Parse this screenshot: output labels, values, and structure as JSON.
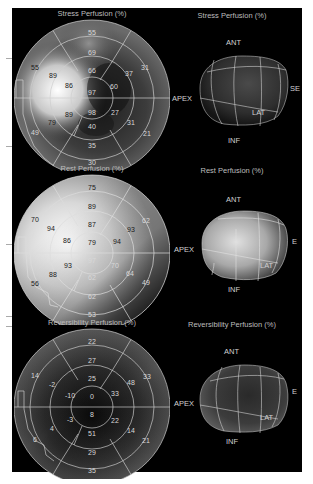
{
  "panels": [
    {
      "id": "stress",
      "map_title": "Stress Perfusion (%)",
      "render_title": "Stress Perfusion (%)",
      "orientation": {
        "ant": "ANT",
        "apex": "APEX",
        "base": "BASE",
        "lat": "LAT",
        "inf": "INF"
      },
      "segments": [
        {
          "v": "55",
          "x": 78,
          "y": 18,
          "light": true
        },
        {
          "v": "69",
          "x": 78,
          "y": 38,
          "light": true
        },
        {
          "v": "66",
          "x": 78,
          "y": 56,
          "light": true
        },
        {
          "v": "97",
          "x": 78,
          "y": 78,
          "light": true
        },
        {
          "v": "60",
          "x": 100,
          "y": 72,
          "light": true
        },
        {
          "v": "37",
          "x": 115,
          "y": 59,
          "light": true
        },
        {
          "v": "31",
          "x": 131,
          "y": 53,
          "light": true
        },
        {
          "v": "98",
          "x": 78,
          "y": 98,
          "light": true
        },
        {
          "v": "27",
          "x": 101,
          "y": 98,
          "light": true
        },
        {
          "v": "31",
          "x": 117,
          "y": 108,
          "light": true
        },
        {
          "v": "21",
          "x": 133,
          "y": 119,
          "light": true
        },
        {
          "v": "40",
          "x": 78,
          "y": 112,
          "light": true
        },
        {
          "v": "35",
          "x": 78,
          "y": 131,
          "light": true
        },
        {
          "v": "30",
          "x": 78,
          "y": 148,
          "light": true
        },
        {
          "v": "55",
          "x": 21,
          "y": 53,
          "light": false
        },
        {
          "v": "89",
          "x": 39,
          "y": 61,
          "light": false
        },
        {
          "v": "86",
          "x": 55,
          "y": 71,
          "light": false
        },
        {
          "v": "89",
          "x": 55,
          "y": 100,
          "light": false
        },
        {
          "v": "79",
          "x": 38,
          "y": 108,
          "light": false
        },
        {
          "v": "49",
          "x": 21,
          "y": 118,
          "light": true
        }
      ]
    },
    {
      "id": "rest",
      "map_title": "Rest Perfusion (%)",
      "render_title": "Rest Perfusion (%)",
      "orientation": {
        "ant": "ANT",
        "apex": "APEX",
        "base": "BASE",
        "lat": "LAT",
        "inf": "INF"
      },
      "segments": [
        {
          "v": "75",
          "x": 78,
          "y": 18,
          "light": false
        },
        {
          "v": "89",
          "x": 78,
          "y": 37,
          "light": false
        },
        {
          "v": "87",
          "x": 78,
          "y": 55,
          "light": false
        },
        {
          "v": "79",
          "x": 78,
          "y": 73,
          "light": false
        },
        {
          "v": "94",
          "x": 103,
          "y": 72,
          "light": false
        },
        {
          "v": "93",
          "x": 117,
          "y": 60,
          "light": false
        },
        {
          "v": "62",
          "x": 132,
          "y": 51,
          "light": true
        },
        {
          "v": "70",
          "x": 21,
          "y": 50,
          "light": false
        },
        {
          "v": "94",
          "x": 37,
          "y": 59,
          "light": false
        },
        {
          "v": "86",
          "x": 53,
          "y": 71,
          "light": false
        },
        {
          "v": "97",
          "x": 78,
          "y": 91,
          "light": true
        },
        {
          "v": "70",
          "x": 101,
          "y": 96,
          "light": true
        },
        {
          "v": "64",
          "x": 116,
          "y": 104,
          "light": true
        },
        {
          "v": "49",
          "x": 132,
          "y": 113,
          "light": true
        },
        {
          "v": "93",
          "x": 54,
          "y": 96,
          "light": false
        },
        {
          "v": "88",
          "x": 39,
          "y": 105,
          "light": false
        },
        {
          "v": "56",
          "x": 21,
          "y": 114,
          "light": false
        },
        {
          "v": "62",
          "x": 78,
          "y": 108,
          "light": true
        },
        {
          "v": "62",
          "x": 78,
          "y": 127,
          "light": true
        },
        {
          "v": "53",
          "x": 78,
          "y": 145,
          "light": true
        }
      ]
    },
    {
      "id": "reversibility",
      "map_title": "Reversibility Perfusion (%)",
      "render_title": "Reversibility Perfusion (%)",
      "orientation": {
        "ant": "ANT",
        "apex": "APEX",
        "base": "BASE",
        "lat": "LAT",
        "inf": "INF"
      },
      "segments": [
        {
          "v": "22",
          "x": 78,
          "y": 18,
          "light": true
        },
        {
          "v": "27",
          "x": 78,
          "y": 37,
          "light": true
        },
        {
          "v": "25",
          "x": 78,
          "y": 55,
          "light": true
        },
        {
          "v": "0",
          "x": 78,
          "y": 73,
          "light": true
        },
        {
          "v": "33",
          "x": 101,
          "y": 70,
          "light": true
        },
        {
          "v": "48",
          "x": 117,
          "y": 59,
          "light": true
        },
        {
          "v": "33",
          "x": 133,
          "y": 53,
          "light": true
        },
        {
          "v": "14",
          "x": 21,
          "y": 52,
          "light": true
        },
        {
          "v": "-2",
          "x": 38,
          "y": 61,
          "light": true
        },
        {
          "v": "-10",
          "x": 56,
          "y": 72,
          "light": true
        },
        {
          "v": "8",
          "x": 78,
          "y": 91,
          "light": true
        },
        {
          "v": "-3",
          "x": 56,
          "y": 96,
          "light": true
        },
        {
          "v": "4",
          "x": 38,
          "y": 105,
          "light": true
        },
        {
          "v": "6",
          "x": 21,
          "y": 116,
          "light": true
        },
        {
          "v": "22",
          "x": 101,
          "y": 97,
          "light": true
        },
        {
          "v": "14",
          "x": 117,
          "y": 107,
          "light": true
        },
        {
          "v": "21",
          "x": 132,
          "y": 117,
          "light": true
        },
        {
          "v": "51",
          "x": 78,
          "y": 110,
          "light": true
        },
        {
          "v": "29",
          "x": 78,
          "y": 129,
          "light": true
        },
        {
          "v": "35",
          "x": 78,
          "y": 147,
          "light": true
        }
      ]
    }
  ]
}
